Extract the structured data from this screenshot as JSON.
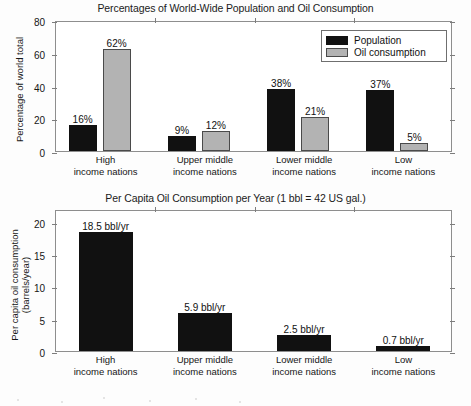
{
  "chart_data": [
    {
      "type": "bar",
      "title": "Percentages of World-Wide Population and Oil Consumption",
      "xlabel": "",
      "ylabel": "Percentage of world total",
      "ylim": [
        0,
        80
      ],
      "yticks": [
        0,
        20,
        40,
        60,
        80
      ],
      "ytick_labels": [
        "0",
        "20",
        "40",
        "60",
        "80"
      ],
      "grid": false,
      "legend_position": "top-right-inside",
      "categories": [
        "High\nincome nations",
        "Upper middle\nincome nations",
        "Lower middle\nincome nations",
        "Low\nincome nations"
      ],
      "category_lines": [
        [
          "High",
          "income nations"
        ],
        [
          "Upper middle",
          "income nations"
        ],
        [
          "Lower middle",
          "income nations"
        ],
        [
          "Low",
          "income nations"
        ]
      ],
      "series": [
        {
          "name": "Population",
          "color": "#111111",
          "values": [
            16,
            9,
            38,
            37
          ],
          "labels": [
            "16%",
            "9%",
            "38%",
            "37%"
          ]
        },
        {
          "name": "Oil consumption",
          "color": "#b3b3b3",
          "values": [
            62,
            12,
            21,
            5
          ],
          "labels": [
            "62%",
            "12%",
            "21%",
            "5%"
          ]
        }
      ]
    },
    {
      "type": "bar",
      "title": "Per Capita Oil Consumption per Year (1 bbl = 42 US gal.)",
      "xlabel": "",
      "ylabel": "Per capita oil consumption (barrels/year)",
      "ylabel_lines": [
        "Per capita oil consumption",
        "(barrels/year)"
      ],
      "ylim": [
        0,
        22
      ],
      "yticks": [
        0,
        5,
        10,
        15,
        20
      ],
      "ytick_labels": [
        "0",
        "5",
        "10",
        "15",
        "20"
      ],
      "grid": false,
      "categories": [
        "High\nincome nations",
        "Upper middle\nincome nations",
        "Lower middle\nincome nations",
        "Low\nincome nations"
      ],
      "category_lines": [
        [
          "High",
          "income nations"
        ],
        [
          "Upper middle",
          "income nations"
        ],
        [
          "Lower middle",
          "income nations"
        ],
        [
          "Low",
          "income nations"
        ]
      ],
      "series": [
        {
          "name": "Per capita oil consumption",
          "color": "#111111",
          "values": [
            18.5,
            5.9,
            2.5,
            0.7
          ],
          "labels": [
            "18.5 bbl/yr",
            "5.9 bbl/yr",
            "2.5 bbl/yr",
            "0.7 bbl/yr"
          ]
        }
      ]
    }
  ],
  "top_chart": {
    "title": "Percentages of World-Wide Population and Oil Consumption",
    "y_axis_title": "Percentage of world total",
    "y_ticks": [
      "80",
      "60",
      "40",
      "20",
      "0"
    ],
    "legend": {
      "items": [
        {
          "label": "Population",
          "swatch": "black-square-icon"
        },
        {
          "label": "Oil consumption",
          "swatch": "gray-square-icon"
        }
      ]
    },
    "groups": [
      {
        "line1": "High",
        "line2": "income nations",
        "population_label": "16%",
        "oil_label": "62%"
      },
      {
        "line1": "Upper middle",
        "line2": "income nations",
        "population_label": "9%",
        "oil_label": "12%"
      },
      {
        "line1": "Lower middle",
        "line2": "income nations",
        "population_label": "38%",
        "oil_label": "21%"
      },
      {
        "line1": "Low",
        "line2": "income nations",
        "population_label": "37%",
        "oil_label": "5%"
      }
    ]
  },
  "bottom_chart": {
    "title": "Per Capita Oil Consumption per Year (1 bbl = 42 US gal.)",
    "y_axis_title_line1": "Per capita oil consumption",
    "y_axis_title_line2": "(barrels/year)",
    "y_ticks": [
      "20",
      "15",
      "10",
      "5",
      "0"
    ],
    "groups": [
      {
        "line1": "High",
        "line2": "income nations",
        "value_label": "18.5 bbl/yr"
      },
      {
        "line1": "Upper middle",
        "line2": "income nations",
        "value_label": "5.9 bbl/yr"
      },
      {
        "line1": "Lower middle",
        "line2": "income nations",
        "value_label": "2.5 bbl/yr"
      },
      {
        "line1": "Low",
        "line2": "income nations",
        "value_label": "0.7 bbl/yr"
      }
    ]
  }
}
